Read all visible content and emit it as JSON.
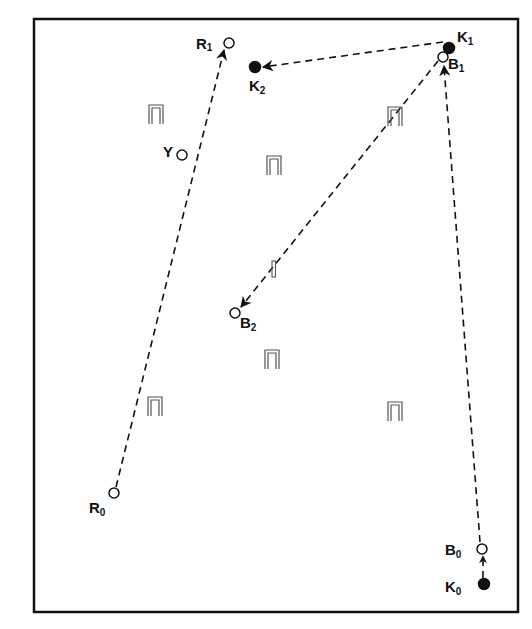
{
  "diagram": {
    "type": "croquet-court-diagram",
    "frame": {
      "x": 34,
      "y": 19,
      "width": 484,
      "height": 593,
      "stroke": "#111111"
    },
    "colors": {
      "line": "#111111",
      "hoop": "#555555",
      "background": "#ffffff"
    },
    "balls": [
      {
        "id": "R1",
        "letter": "R",
        "sub": "1",
        "filled": false,
        "cx": 229,
        "cy": 43
      },
      {
        "id": "K2",
        "letter": "K",
        "sub": "2",
        "filled": true,
        "cx": 255,
        "cy": 67
      },
      {
        "id": "K1",
        "letter": "K",
        "sub": "1",
        "filled": true,
        "cx": 449,
        "cy": 48
      },
      {
        "id": "B1",
        "letter": "B",
        "sub": "1",
        "filled": false,
        "cx": 443,
        "cy": 57
      },
      {
        "id": "Y",
        "letter": "Y",
        "sub": "",
        "filled": false,
        "cx": 182,
        "cy": 155
      },
      {
        "id": "B2",
        "letter": "B",
        "sub": "2",
        "filled": false,
        "cx": 235,
        "cy": 313
      },
      {
        "id": "R0",
        "letter": "R",
        "sub": "0",
        "filled": false,
        "cx": 114,
        "cy": 493
      },
      {
        "id": "B0",
        "letter": "B",
        "sub": "0",
        "filled": false,
        "cx": 482,
        "cy": 549
      },
      {
        "id": "K0",
        "letter": "K",
        "sub": "0",
        "filled": true,
        "cx": 484,
        "cy": 584
      }
    ],
    "labels": {
      "R1": {
        "letter": "R",
        "sub": "1"
      },
      "K2": {
        "letter": "K",
        "sub": "2"
      },
      "K1": {
        "letter": "K",
        "sub": "1"
      },
      "B1": {
        "letter": "B",
        "sub": "1"
      },
      "Y": {
        "letter": "Y"
      },
      "B2": {
        "letter": "B",
        "sub": "2"
      },
      "R0": {
        "letter": "R",
        "sub": "0"
      },
      "B0": {
        "letter": "B",
        "sub": "0"
      },
      "K0": {
        "letter": "K",
        "sub": "0"
      }
    },
    "paths": [
      {
        "from": "R0",
        "to": "R1",
        "style": "dashed",
        "arrow": true
      },
      {
        "from": "K1",
        "to": "K2",
        "style": "dashed",
        "arrow": true
      },
      {
        "from": "B1",
        "to": "B2",
        "style": "dashed",
        "arrow": true
      },
      {
        "from": "B0",
        "to": "B1",
        "style": "dashed",
        "arrow": true
      },
      {
        "from": "K0",
        "to": "B0",
        "style": "dashed",
        "arrow": true
      }
    ],
    "hoops": [
      {
        "id": "hoop-1",
        "x": 155,
        "y": 114
      },
      {
        "id": "hoop-2",
        "x": 395,
        "y": 116
      },
      {
        "id": "hoop-3",
        "x": 273,
        "y": 166
      },
      {
        "id": "hoop-4",
        "x": 272,
        "y": 356
      },
      {
        "id": "hoop-5",
        "x": 155,
        "y": 405
      },
      {
        "id": "hoop-6",
        "x": 395,
        "y": 412
      }
    ],
    "stake": {
      "x": 272,
      "y": 261,
      "height": 16
    }
  }
}
